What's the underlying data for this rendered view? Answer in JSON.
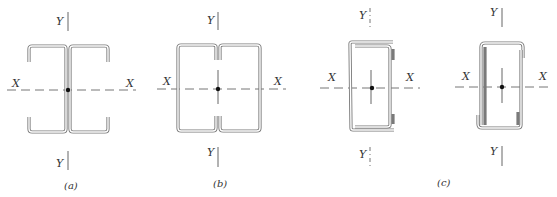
{
  "diagram": {
    "colors": {
      "steel_outline": "#7a7a7a",
      "axis": "#666666",
      "centroid": "#111111",
      "text": "#333333"
    },
    "figures": [
      {
        "id": "a",
        "caption": "(a)",
        "shape": "I-section from two back-to-back lipped channels",
        "axis_labels": {
          "x_left": "X",
          "x_right": "X",
          "y_top": "Y",
          "y_bottom": "Y"
        }
      },
      {
        "id": "b",
        "caption": "(b)",
        "shape": "Box section from two toe-to-toe lipped channels",
        "axis_labels": {
          "x_left": "X",
          "x_right": "X",
          "y_top": "Y",
          "y_bottom": "Y"
        }
      },
      {
        "id": "c1",
        "caption": "",
        "shape": "Box section from nested channel and lipped channel",
        "axis_labels": {
          "x_left": "X",
          "x_right": "X",
          "y_top": "Y",
          "y_bottom": "Y"
        }
      },
      {
        "id": "c2",
        "caption": "(c)",
        "shape": "Box section from two overlapping lipped channels",
        "axis_labels": {
          "x_left": "X",
          "x_right": "X",
          "y_top": "Y",
          "y_bottom": "Y"
        }
      }
    ]
  }
}
